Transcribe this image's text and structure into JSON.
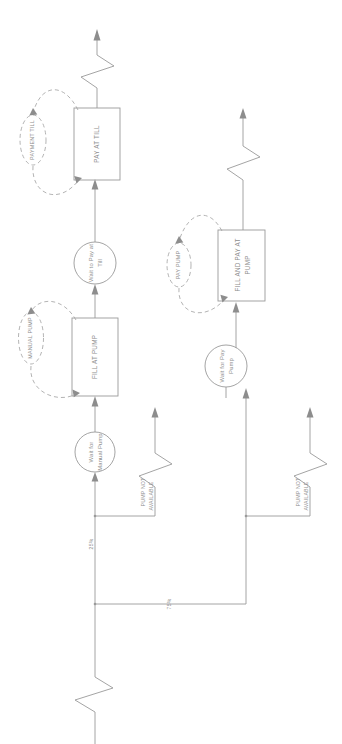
{
  "diagram": {
    "orientation": "rotated-90",
    "colors": {
      "stroke": "#9a9a9a",
      "dashed_stroke": "#a5a5a5",
      "text": "#8e8e8e",
      "shape_fill": "#fefefe",
      "background": "#ffffff"
    }
  },
  "nodes": {
    "pay_at_till": {
      "label": "PAY AT TILL",
      "shape": "rectangle"
    },
    "fill_at_pump": {
      "label": "FILL AT PUMP",
      "shape": "rectangle"
    },
    "fill_and_pay_at_pump": {
      "label_line1": "FILL AND PAY AT",
      "label_line2": "PUMP",
      "shape": "rectangle"
    },
    "wait_to_pay_at_till": {
      "label_line1": "Wait to Pay at",
      "label_line2": "Till",
      "shape": "circle"
    },
    "wait_for_manual_pump": {
      "label_line1": "Wait for",
      "label_line2": "Manual Pump",
      "shape": "circle"
    },
    "wait_for_pay_pump": {
      "label_line1": "Wait for Pay",
      "label_line2": "Pump",
      "shape": "circle"
    },
    "payment_till": {
      "label": "PAYMENT TILL",
      "shape": "ellipse"
    },
    "manual_pump": {
      "label": "MANUAL PUMP",
      "shape": "ellipse"
    },
    "pay_pump": {
      "label": "PAY PUMP",
      "shape": "ellipse"
    }
  },
  "edge_labels": {
    "branch_manual_pct": "25%",
    "branch_pay_pump_pct": "75%",
    "pump_not_available_1_line1": "PUMP NOT",
    "pump_not_available_1_line2": "AVAILABLE",
    "pump_not_available_2_line1": "PUMP NOT",
    "pump_not_available_2_line2": "AVAILABLE"
  }
}
